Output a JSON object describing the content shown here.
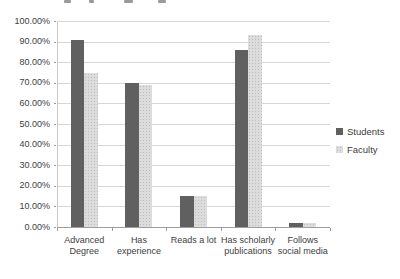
{
  "figure": {
    "background": "#ffffff",
    "note_top_edge": "bottom fragments of a cropped text line are visible at the very top edge"
  },
  "chart_data": {
    "type": "bar",
    "title": "",
    "categories": [
      "Advanced Degree",
      "Has experience",
      "Reads a lot",
      "Has scholarly publications",
      "Follows social media"
    ],
    "series": [
      {
        "name": "Students",
        "values": [
          91,
          70,
          15,
          86,
          2
        ],
        "color": "#606060",
        "texture": "solid"
      },
      {
        "name": "Faculty",
        "values": [
          75,
          69,
          15,
          93,
          2
        ],
        "color": "#dcdcdc",
        "texture": "halftone"
      }
    ],
    "xlabel": "",
    "ylabel": "",
    "ylim": [
      0,
      100
    ],
    "ytick_step": 10,
    "ytick_labels": [
      "0.00%",
      "10.00%",
      "20.00%",
      "30.00%",
      "40.00%",
      "50.00%",
      "60.00%",
      "70.00%",
      "80.00%",
      "90.00%",
      "100.00%"
    ],
    "grid": true,
    "gridline_color": "#d6d6d6",
    "axis_color": "#9e9e9e",
    "legend_position": "right",
    "legend_entries": [
      "Students",
      "Faculty"
    ]
  }
}
